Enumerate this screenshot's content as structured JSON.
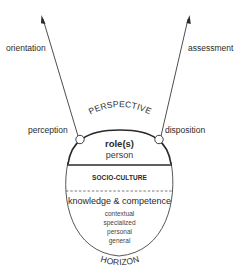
{
  "diagram": {
    "arrows": {
      "left_label": "orientation",
      "right_label": "assessment"
    },
    "nodes": {
      "left_label": "perception",
      "right_label": "disposition"
    },
    "top_arc_label": "PERSPECTIVE",
    "bottom_arc_label": "HORIZON",
    "sections": {
      "top": {
        "title": "role(s)",
        "subtitle": "person"
      },
      "middle": {
        "title": "SOCIO-CULTURE"
      },
      "bottom": {
        "title": "knowledge & competence",
        "items": [
          "contextual",
          "specialized",
          "personal",
          "general"
        ]
      }
    },
    "colors": {
      "stroke": "#2a2a2a",
      "background": "#ffffff"
    }
  }
}
